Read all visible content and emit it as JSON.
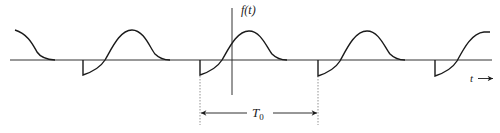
{
  "figure": {
    "y_axis_label": "f(t)",
    "x_axis_label": "t",
    "period_label": "T",
    "period_subscript": "0",
    "colors": {
      "stroke": "#1a1a1a",
      "axis": "#333333",
      "dotted": "#777777"
    }
  },
  "geometry": {
    "baseline_y": 60,
    "axis_x": 232,
    "period_px": 117.5,
    "period_starts_x": [
      83,
      200,
      318,
      435
    ],
    "dip_y": 75,
    "peak_y": 31
  }
}
